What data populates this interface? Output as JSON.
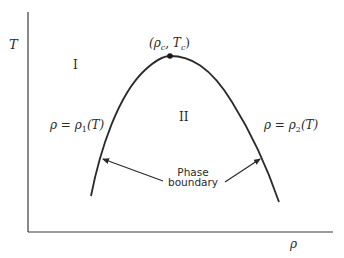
{
  "diagram": {
    "axes": {
      "y_label": "T",
      "x_label": "ρ"
    },
    "regions": {
      "region_1": "I",
      "region_2": "II"
    },
    "critical_point": {
      "label": "(ρc, Tc)",
      "label_main": "(ρ",
      "label_sub_c1": "c",
      "label_mid": ", T",
      "label_sub_c2": "c",
      "label_end": ")"
    },
    "left_curve_label": {
      "lhs": "ρ = ρ",
      "sub": "1",
      "rhs": "(T)"
    },
    "right_curve_label": {
      "lhs": "ρ = ρ",
      "sub": "2",
      "rhs": "(T)"
    },
    "annotation": {
      "line1": "Phase",
      "line2": "boundary"
    },
    "colors": {
      "ink": "#2a2a2a",
      "background": "#ffffff"
    }
  }
}
